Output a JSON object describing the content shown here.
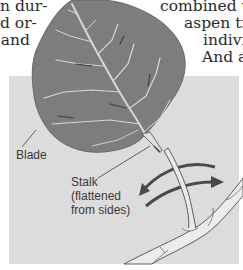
{
  "page": {
    "left_column_fragments": [
      "n dur-",
      "d or-",
      "and"
    ],
    "right_column_fragments": [
      "combined with",
      "aspen tree",
      "individ",
      "And a"
    ]
  },
  "figure": {
    "labels": {
      "blade": "Blade",
      "stalk": [
        "Stalk",
        "(flattened",
        "from sides)"
      ]
    },
    "colors": {
      "panel_background": "#dcdcdc",
      "leaf_fill": "#7d7d7d",
      "leaf_vein": "#d8d8d8",
      "stalk_fill": "#e6e6e6",
      "arrow": "#4a4a4a",
      "leader_line": "#3a3a3a"
    },
    "icons": [
      "motion-arrow-icon"
    ]
  }
}
